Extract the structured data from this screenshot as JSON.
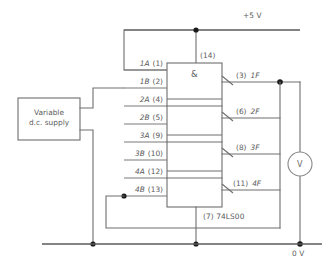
{
  "diagram": {
    "ic": {
      "part_number": "74LS00",
      "gate_symbol": "&",
      "gate_count": 4,
      "power_pin": {
        "label": "(14)",
        "net": "+5 V"
      },
      "ground_pin": {
        "label": "(7)",
        "net": "0 V"
      },
      "ground_caption": "(7)  74LS00"
    },
    "rails": {
      "positive": {
        "label": "+5 V",
        "color": "#5b5b5b"
      },
      "negative": {
        "label": "0 V",
        "color": "#5b5b5b"
      }
    },
    "inputs": [
      {
        "name": "1A",
        "pin": "(1)"
      },
      {
        "name": "1B",
        "pin": "(2)"
      },
      {
        "name": "2A",
        "pin": "(4)"
      },
      {
        "name": "2B",
        "pin": "(5)"
      },
      {
        "name": "3A",
        "pin": "(9)"
      },
      {
        "name": "3B",
        "pin": "(10)"
      },
      {
        "name": "4A",
        "pin": "(12)"
      },
      {
        "name": "4B",
        "pin": "(13)"
      }
    ],
    "outputs": [
      {
        "pin": "(3)",
        "name": "1F"
      },
      {
        "pin": "(6)",
        "name": "2F"
      },
      {
        "pin": "(8)",
        "name": "3F"
      },
      {
        "pin": "(11)",
        "name": "4F"
      }
    ],
    "source": {
      "line1": "Variable",
      "line2": "d.c. supply"
    },
    "meter": {
      "symbol": "V",
      "type": "voltmeter"
    },
    "colors": {
      "wire": "#6e6e6e",
      "text": "#5b5b5b",
      "node": "#1a1a1a",
      "background": "#ffffff"
    }
  }
}
